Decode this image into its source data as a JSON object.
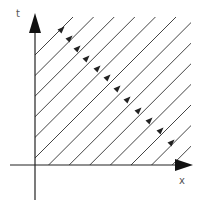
{
  "diagram": {
    "type": "characteristic-lines",
    "axes": {
      "horizontal_label": "x",
      "vertical_label": "t"
    },
    "line_count": 13,
    "line_direction": "up-right",
    "colors": {
      "axis": "#222222",
      "line": "#444444",
      "arrow": "#222222",
      "label": "#555555"
    }
  }
}
